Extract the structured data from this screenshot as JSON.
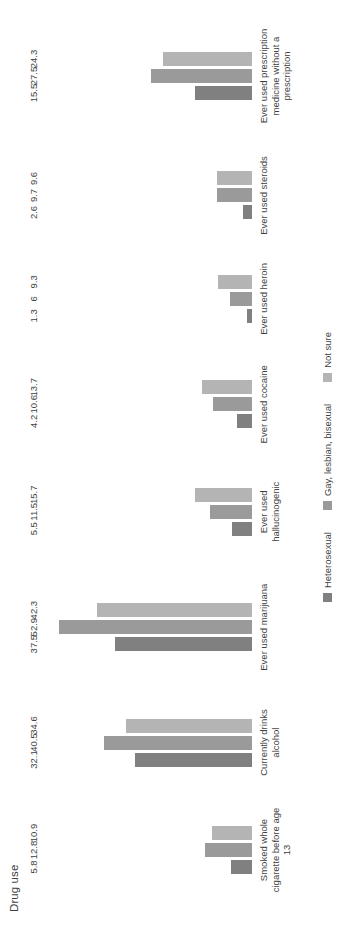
{
  "chart_data": {
    "type": "bar",
    "title": "Drug use",
    "xlabel": "",
    "ylabel": "",
    "orientation": "vertical-grouped",
    "grid": false,
    "legend_position": "bottom",
    "ylim": [
      0,
      58
    ],
    "categories": [
      "Smoked whole cigarette before age 13",
      "Currently drinks alcohol",
      "Ever used marijuana",
      "Ever used hallucinogenic",
      "Ever used cocaine",
      "Ever used heroin",
      "Ever used steroids",
      "Ever used prescription medicine without a prescription"
    ],
    "series": [
      {
        "name": "Heterosexual",
        "color": "#808080",
        "values": [
          5.8,
          32.1,
          37.5,
          5.5,
          4.2,
          1.3,
          2.6,
          15.5
        ],
        "labels": [
          "5.8",
          "32.1",
          "37.5",
          "5.5",
          "4.2",
          "1.3",
          "2.6",
          "15.5"
        ]
      },
      {
        "name": "Gay, lesbian, bisexual",
        "color": "#9a9a9a",
        "values": [
          12.8,
          40.5,
          52.9,
          11.5,
          10.6,
          6,
          9.7,
          27.5
        ],
        "labels": [
          "12.8",
          "40.5",
          "52.9",
          "11.5",
          "10.6",
          "6",
          "9.7",
          "27.5"
        ]
      },
      {
        "name": "Not sure",
        "color": "#b4b4b4",
        "values": [
          10.9,
          34.6,
          42.3,
          15.7,
          13.7,
          9.3,
          9.6,
          24.3
        ],
        "labels": [
          "10.9",
          "34.6",
          "42.3",
          "15.7",
          "13.7",
          "9.3",
          "9.6",
          "24.3"
        ]
      }
    ]
  },
  "legend": {
    "items": [
      {
        "label": "Heterosexual",
        "color": "#808080"
      },
      {
        "label": "Gay, lesbian, bisexual",
        "color": "#9a9a9a"
      },
      {
        "label": "Not sure",
        "color": "#b4b4b4"
      }
    ]
  }
}
